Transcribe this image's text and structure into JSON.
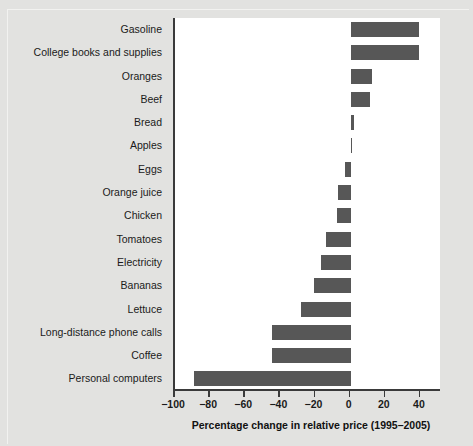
{
  "chart_data": {
    "type": "bar",
    "orientation": "horizontal",
    "title": "",
    "xlabel": "Percentage change in relative price (1995–2005)",
    "ylabel": "",
    "xlim": [
      -100,
      52
    ],
    "ylim": null,
    "grid": false,
    "legend": null,
    "bar_color": "#575757",
    "plot_background": "#ffffff",
    "figure_background": "#e2e2e0",
    "axis_color": "#3a3a3a",
    "xticks": [
      -100,
      -80,
      -60,
      -40,
      -20,
      0,
      20,
      40
    ],
    "xticklabels": [
      "−100",
      "−80",
      "−60",
      "−40",
      "−20",
      "0",
      "20",
      "40"
    ],
    "categories": [
      "Gasoline",
      "College books and supplies",
      "Oranges",
      "Beef",
      "Bread",
      "Apples",
      "Eggs",
      "Orange juice",
      "Chicken",
      "Tomatoes",
      "Electricity",
      "Bananas",
      "Lettuce",
      "Long-distance phone calls",
      "Coffee",
      "Personal computers"
    ],
    "values": [
      39,
      39,
      12,
      11,
      2,
      0.5,
      -3,
      -7,
      -8,
      -14,
      -17,
      -21,
      -28,
      -45,
      -45,
      -89
    ]
  },
  "axis": {
    "xtitle": "Percentage change in relative price (1995–2005)"
  }
}
